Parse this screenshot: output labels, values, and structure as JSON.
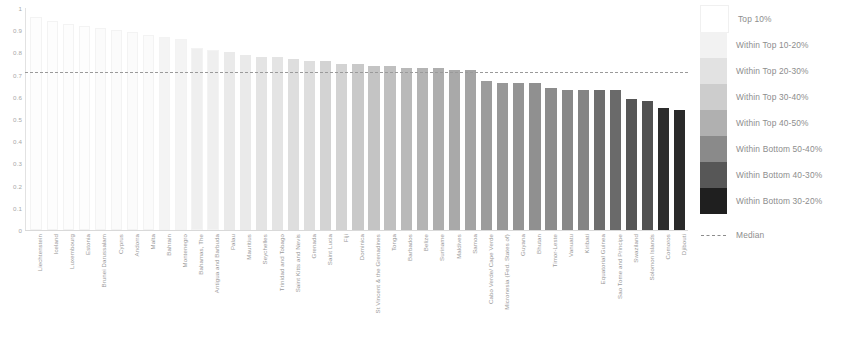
{
  "chart_data": {
    "type": "bar",
    "title": "",
    "subtitle": "",
    "xlabel": "",
    "ylabel": "",
    "ylim": [
      0,
      1
    ],
    "grid": false,
    "legend_position": "right",
    "y_ticks": [
      "0",
      "0.1",
      "0.2",
      "0.3",
      "0.4",
      "0.5",
      "0.6",
      "0.7",
      "0.8",
      "0.9",
      "1"
    ],
    "median": 0.71,
    "median_label": "Median",
    "categories": [
      "Liechtenstein",
      "Iceland",
      "Luxembourg",
      "Estonia",
      "Brunei Darussalam",
      "Cyprus",
      "Andorra",
      "Malta",
      "Bahrain",
      "Montenegro",
      "Bahamas, The",
      "Antigua and Barbuda",
      "Palau",
      "Mauritius",
      "Seychelles",
      "Trinidad and Tobago",
      "Saint Kitts and Nevis",
      "Grenada",
      "Saint Lucia",
      "Fiji",
      "Dominica",
      "St Vincent & the Grenadines",
      "Tonga",
      "Barbados",
      "Belize",
      "Suriname",
      "Maldives",
      "Samoa",
      "Cabo Verde/ Cape Verde",
      "Micronesia (Fed. States of)",
      "Guyana",
      "Bhutan",
      "Timor-Leste",
      "Vanuatu",
      "Kiribati",
      "Equatorial Guinea",
      "Sao Tome and Principe",
      "Swaziland",
      "Solomon Islands",
      "Comoros",
      "Djibouti"
    ],
    "values": [
      0.96,
      0.94,
      0.93,
      0.92,
      0.91,
      0.9,
      0.89,
      0.88,
      0.87,
      0.86,
      0.82,
      0.81,
      0.8,
      0.79,
      0.78,
      0.78,
      0.77,
      0.76,
      0.76,
      0.75,
      0.75,
      0.74,
      0.74,
      0.73,
      0.73,
      0.73,
      0.72,
      0.72,
      0.67,
      0.66,
      0.66,
      0.66,
      0.64,
      0.63,
      0.63,
      0.63,
      0.63,
      0.59,
      0.58,
      0.55,
      0.54
    ],
    "bar_colors": [
      "#fdfdfd",
      "#fdfdfd",
      "#fdfdfd",
      "#fdfdfd",
      "#fbfbfb",
      "#fbfbfb",
      "#fbfbfb",
      "#fbfbfb",
      "#f4f4f4",
      "#f4f4f4",
      "#efefef",
      "#efefef",
      "#eaeaea",
      "#eaeaea",
      "#e4e4e4",
      "#e4e4e4",
      "#dedede",
      "#dedede",
      "#d3d3d3",
      "#d3d3d3",
      "#c9c9c9",
      "#c4c4c4",
      "#bfbfbf",
      "#b9b9b9",
      "#b4b4b4",
      "#aeaeae",
      "#a9a9a9",
      "#a4a4a4",
      "#9c9c9c",
      "#989898",
      "#949494",
      "#909090",
      "#8c8c8c",
      "#888888",
      "#848484",
      "#6e6e6e",
      "#6a6a6a",
      "#575757",
      "#525252",
      "#2c2c2c",
      "#2a2a2a"
    ],
    "legend": [
      {
        "label": "Top 10%",
        "color": "#ffffff"
      },
      {
        "label": "Within Top 10-20%",
        "color": "#f2f2f2"
      },
      {
        "label": "Within Top 20-30%",
        "color": "#e2e2e2"
      },
      {
        "label": "Within Top 30-40%",
        "color": "#cdcdcd"
      },
      {
        "label": "Within Top 40-50%",
        "color": "#b0b0b0"
      },
      {
        "label": "Within Bottom 50-40%",
        "color": "#8a8a8a"
      },
      {
        "label": "Within Bottom 40-30%",
        "color": "#575757"
      },
      {
        "label": "Within Bottom 30-20%",
        "color": "#1f1f1f"
      }
    ]
  }
}
